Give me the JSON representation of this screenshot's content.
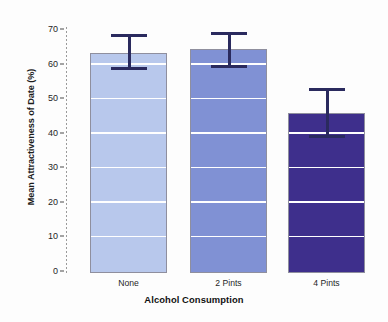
{
  "chart_data": {
    "type": "bar",
    "title": "",
    "xlabel": "Alcohol Consumption",
    "ylabel": "Mean Attractiveness of Date (%)",
    "categories": [
      "None",
      "2 Pints",
      "4 Pints"
    ],
    "values": [
      63.5,
      64.8,
      46.3
    ],
    "error_bars": {
      "lower": [
        58.7,
        59.3,
        39.0
      ],
      "upper": [
        69.0,
        69.7,
        53.5
      ]
    },
    "ylim": [
      0,
      70
    ],
    "yticks": [
      0,
      10,
      20,
      30,
      40,
      50,
      60,
      70
    ],
    "ytick_labels": [
      "0",
      "10",
      "20",
      "30",
      "40",
      "50",
      "60",
      "70"
    ],
    "grid": true,
    "grid_color": "#ffffff",
    "legend": "none",
    "bar_colors": [
      "#b8c8ec",
      "#8091d4",
      "#3e2f8c"
    ],
    "bar_edge_color": "#8f8f9e",
    "error_bar_color": "#2a2a5e",
    "axis_color": "#9a9a9a",
    "background": "#fdfdfd"
  }
}
